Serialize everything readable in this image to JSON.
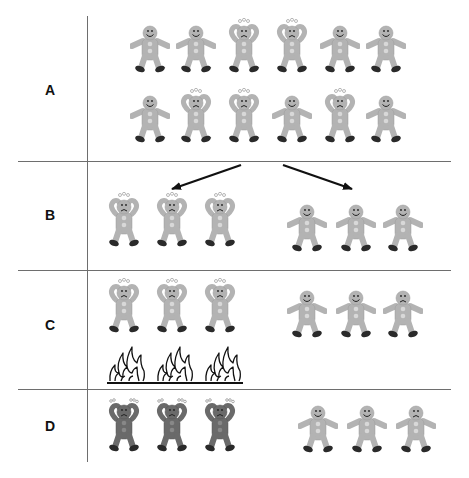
{
  "rows": [
    {
      "label": "A"
    },
    {
      "label": "B"
    },
    {
      "label": "C"
    },
    {
      "label": "D"
    }
  ],
  "legend_states": {
    "happy": "smiling gingerbread figure, arms out",
    "stressed": "frowning gingerbread figure, hands on head, sweat drops",
    "stressed_dark": "darker frowning gingerbread figure, hands on head",
    "sad": "frowning gingerbread figure, arms out"
  },
  "colors": {
    "figure_light": "#b3b3b3",
    "figure_dark": "#6a6a6a",
    "feet": "#2a2a2a",
    "lines": "#6e6e6e",
    "arrow": "#111111"
  },
  "panel_A": {
    "row1": [
      "happy",
      "happy",
      "stressed",
      "stressed",
      "happy",
      "happy"
    ],
    "row2": [
      "happy",
      "stressed",
      "stressed",
      "happy",
      "stressed",
      "happy"
    ]
  },
  "panel_B": {
    "left": [
      "stressed",
      "stressed",
      "stressed"
    ],
    "right": [
      "happy",
      "happy",
      "happy"
    ]
  },
  "panel_C": {
    "left": [
      "stressed",
      "stressed",
      "stressed"
    ],
    "left_below": [
      "fire",
      "fire",
      "fire"
    ],
    "right": [
      "happy",
      "happy",
      "sad"
    ]
  },
  "panel_D": {
    "left": [
      "stressed_dark",
      "stressed_dark",
      "stressed_dark"
    ],
    "right": [
      "happy",
      "happy",
      "sad"
    ]
  }
}
